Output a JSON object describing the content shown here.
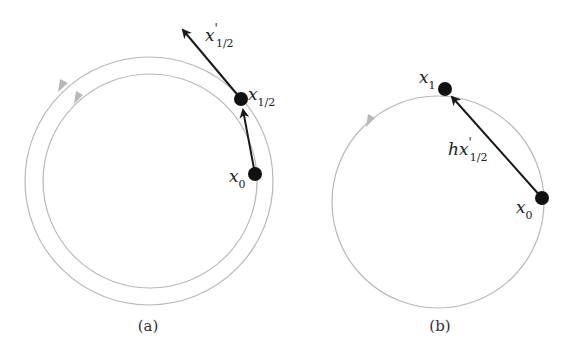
{
  "panels": [
    {
      "id": "a",
      "caption": "(a)",
      "circles": [
        {
          "name": "outer-orbit",
          "cx": 149,
          "cy": 181,
          "r": 124
        },
        {
          "name": "inner-orbit",
          "cx": 150,
          "cy": 181,
          "r": 107
        }
      ],
      "points": [
        {
          "name": "x0",
          "x": 255,
          "y": 174
        },
        {
          "name": "x_half",
          "x": 241,
          "y": 99
        }
      ],
      "labels": {
        "x0": {
          "main": "x",
          "sub": "0"
        },
        "x_half": {
          "main": "x",
          "sub": "1/2"
        },
        "x_half_prime": {
          "main": "x",
          "prime": "'",
          "sub": "1/2"
        }
      }
    },
    {
      "id": "b",
      "caption": "(b)",
      "circles": [
        {
          "name": "orbit",
          "cx": 438,
          "cy": 202,
          "r": 106
        }
      ],
      "points": [
        {
          "name": "x0",
          "x": 542,
          "y": 198
        },
        {
          "name": "x1",
          "x": 445,
          "y": 89
        }
      ],
      "labels": {
        "x0": {
          "main": "x",
          "sub": "0"
        },
        "x1": {
          "main": "x",
          "sub": "1"
        },
        "step": {
          "main": "hx",
          "prime": "'",
          "sub": "1/2"
        }
      }
    }
  ],
  "colors": {
    "orbit": "#b8b8b8",
    "arrow": "#1a1a1a",
    "point": "#111111"
  }
}
